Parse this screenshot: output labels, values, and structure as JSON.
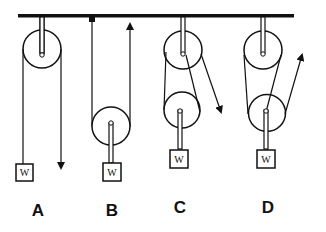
{
  "diagram": {
    "title": "",
    "type": "pulley-systems",
    "colors": {
      "ink": "#111111",
      "background": "#ffffff"
    },
    "systems": [
      {
        "id": "A",
        "label": "A",
        "weight_label": "W",
        "pulleys": 1,
        "description": "Single fixed pulley, pull downward"
      },
      {
        "id": "B",
        "label": "B",
        "weight_label": "W",
        "pulleys": 1,
        "description": "Single movable pulley, pull upward"
      },
      {
        "id": "C",
        "label": "C",
        "weight_label": "W",
        "pulleys": 2,
        "description": "Fixed + movable pulley, pull downward"
      },
      {
        "id": "D",
        "label": "D",
        "weight_label": "W",
        "pulleys": 2,
        "description": "Fixed + movable pulley, pull upward"
      }
    ]
  }
}
